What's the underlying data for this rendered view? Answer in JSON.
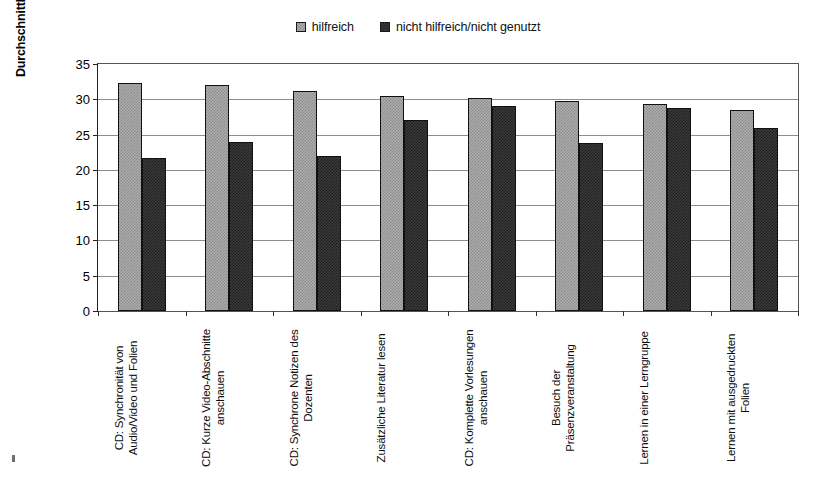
{
  "chart_data": {
    "type": "bar",
    "title": "",
    "subtitle": "",
    "xlabel": "",
    "ylabel": "Durchschnittliche Punktzahl in der Klausur",
    "ylim": [
      0,
      35
    ],
    "ytick_step": 5,
    "yticks": [
      "35",
      "30",
      "25",
      "20",
      "15",
      "10",
      "5",
      "0"
    ],
    "grid": true,
    "legend_position": "top-center",
    "categories": [
      "CD: Synchronität von Audio/Video und Folien",
      "CD: Kurze Video-Abschnitte anschauen",
      "CD: Synchrone Notizen des Dozenten",
      "Zusätzliche Literatur lesen",
      "CD: Komplette Vorlesungen anschauen",
      "Besuch der Präsenzveranstaltung",
      "Lernen in einer Lerngruppe",
      "Lernen mit ausgedruckten Folien"
    ],
    "series": [
      {
        "name": "hilfreich",
        "color": "#adadad",
        "values": [
          32.3,
          32.0,
          31.2,
          30.5,
          30.2,
          29.7,
          29.4,
          28.5
        ]
      },
      {
        "name": "nicht hilfreich/nicht genutzt",
        "color": "#3b3b3b",
        "values": [
          21.7,
          24.0,
          22.0,
          27.0,
          29.1,
          23.8,
          28.8,
          26.0
        ]
      }
    ]
  },
  "legend": {
    "entries": [
      {
        "label": "hilfreich",
        "swatch": "legend-swatch-hilfreich"
      },
      {
        "label": "nicht hilfreich/nicht genutzt",
        "swatch": "legend-swatch-nicht-hilfreich"
      }
    ]
  },
  "axis": {
    "y_title": "Durchschnittliche Punktzahl in der Klausur"
  },
  "colors": {
    "series_light": "#adadad",
    "series_dark": "#3b3b3b",
    "gridline": "#8d8d8d",
    "axis": "#222222",
    "background": "#ffffff"
  }
}
